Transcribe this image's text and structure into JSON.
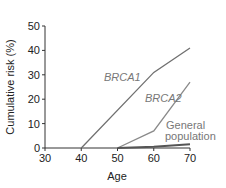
{
  "chart_data": {
    "type": "line",
    "title": "",
    "xlabel": "Age",
    "ylabel": "Cumulative risk (%)",
    "xlim": [
      30,
      70
    ],
    "ylim": [
      0,
      50
    ],
    "x_ticks": [
      "30",
      "40",
      "50",
      "60",
      "70"
    ],
    "y_ticks": [
      "0",
      "10",
      "20",
      "30",
      "40",
      "50"
    ],
    "grid": false,
    "legend": "inline labels",
    "series": [
      {
        "name": "BRCA1",
        "italic": true,
        "x": [
          40,
          60,
          70
        ],
        "values": [
          0,
          31,
          41
        ],
        "color": "#707070"
      },
      {
        "name": "BRCA2",
        "italic": true,
        "x": [
          50,
          60,
          70
        ],
        "values": [
          0,
          7,
          27
        ],
        "color": "#8a8a8a"
      },
      {
        "name": "General population",
        "italic": false,
        "x": [
          50,
          60,
          70
        ],
        "values": [
          0,
          0.5,
          1.5
        ],
        "color": "#555555"
      }
    ]
  },
  "labels": {
    "brca1": "BRCA1",
    "brca2": "BRCA2",
    "general_line1": "General",
    "general_line2": "population"
  }
}
